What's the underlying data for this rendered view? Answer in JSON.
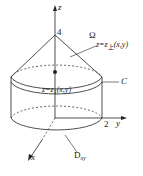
{
  "diagram": {
    "labels": {
      "z_axis": "z",
      "x_axis": "x",
      "y_axis": "y",
      "apex_value": "4",
      "radius_value": "2",
      "omega": "Ω",
      "upper_surface": "z=z",
      "upper_sub": "上",
      "upper_args": "(x,y)",
      "lower_surface": "z=z",
      "lower_sub": "1",
      "lower_args": "(x,y)",
      "curve": "C",
      "domain": "D",
      "domain_sub": "xy"
    },
    "colors": {
      "line": "#222222",
      "background": "#ffffff"
    }
  }
}
